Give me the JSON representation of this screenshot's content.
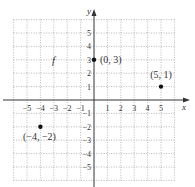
{
  "chart_data": {
    "type": "scatter",
    "title": "",
    "function_label": "f",
    "xlabel": "x",
    "ylabel": "y",
    "xlim": [
      -6,
      6
    ],
    "ylim": [
      -6,
      6
    ],
    "grid": true,
    "grid_style": "dotted",
    "x_ticks": [
      -5,
      -4,
      -3,
      -2,
      -1,
      1,
      2,
      3,
      4,
      5
    ],
    "y_ticks": [
      -5,
      -4,
      -3,
      -2,
      -1,
      1,
      2,
      3,
      4,
      5
    ],
    "x_tick_labels": [
      "−5",
      "−4",
      "−3",
      "−2",
      "−1",
      "1",
      "2",
      "3",
      "4",
      "5"
    ],
    "y_tick_labels": [
      "−5",
      "−4",
      "−3",
      "−2",
      "−1",
      "1",
      "2",
      "3",
      "4",
      "5"
    ],
    "points": [
      {
        "x": 0,
        "y": 3,
        "label": "(0, 3)"
      },
      {
        "x": 5,
        "y": 1,
        "label": "(5, 1)"
      },
      {
        "x": -4,
        "y": -2,
        "label": "(−4, −2)"
      }
    ]
  },
  "axis": {
    "x_label": "x",
    "y_label": "y"
  },
  "labels": {
    "function": "f",
    "p1": "(0, 3)",
    "p2": "(5, 1)",
    "p3": "(−4, −2)"
  }
}
